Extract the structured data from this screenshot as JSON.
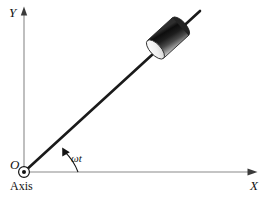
{
  "figure": {
    "background_color": "#ffffff",
    "width": 271,
    "height": 199
  },
  "axes": {
    "y_axis": {
      "label": "Y",
      "icon": "axis-arrow-up-icon",
      "color": "#8a8a8a",
      "origin_x": 24,
      "top_y": 8,
      "bottom_y": 172
    },
    "x_axis": {
      "label": "X",
      "icon": "axis-arrow-right-icon",
      "color": "#8a8a8a",
      "origin_y": 172,
      "left_x": 24,
      "right_x": 257
    },
    "origin": {
      "label": "O",
      "marker_label": "Axis",
      "marker_icon": "axis-out-of-page-icon",
      "x": 24,
      "y": 172,
      "outer_radius": 5.5,
      "dot_radius": 2.0,
      "color": "#111111"
    }
  },
  "rod": {
    "name": "rotating-rod",
    "color": "#1a1a1a",
    "width_px": 2.6,
    "start_x": 24,
    "start_y": 172,
    "end_x": 200,
    "end_y": 11,
    "angle_degrees": 42
  },
  "bead": {
    "name": "bead-mass-on-rod",
    "shape": "cylinder",
    "center_x": 168,
    "center_y": 38,
    "length_px": 34,
    "diameter_px": 24,
    "body_dark_color": "#111111",
    "body_mid_color": "#6e6e6e",
    "body_light_color": "#e8e8e8",
    "cap_color": "#f2f2f2",
    "outline_color": "#2b2b2b"
  },
  "angle_annotation": {
    "label": "ωt",
    "arc_name": "angle-arc",
    "arrow_icon": "arc-arrowhead-icon",
    "color": "#111111",
    "radius": 54,
    "from_degrees": 0,
    "to_degrees": 42,
    "arc_start_x": 78,
    "arc_start_y": 172,
    "arc_end_x": 64,
    "arc_end_y": 151
  }
}
